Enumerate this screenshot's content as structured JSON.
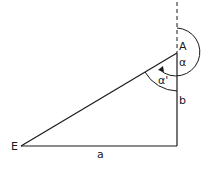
{
  "diagram": {
    "points": {
      "A": {
        "label": "A",
        "x": 177,
        "y": 53
      },
      "E": {
        "label": "E",
        "x": 21,
        "y": 146
      },
      "corner": {
        "x": 177,
        "y": 146
      }
    },
    "labels": {
      "A": "A",
      "E": "E",
      "side_a": "a",
      "side_b": "b",
      "angle_alpha": "α",
      "angle_alpha_prime": "α'"
    },
    "colors": {
      "stroke": "#1a1a1a",
      "background": "#ffffff"
    }
  }
}
